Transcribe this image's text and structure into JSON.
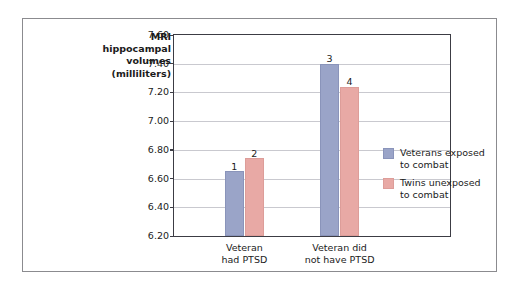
{
  "chart_data": {
    "type": "bar",
    "title": "",
    "ylabel_lines": [
      "MRI",
      "hippocampal",
      "volumes",
      "(milliliters)"
    ],
    "ylabel": "MRI hippocampal volumes (milliliters)",
    "xlabel": "",
    "categories": [
      "Veteran had PTSD",
      "Veteran did not have PTSD"
    ],
    "category_lines": [
      [
        "Veteran",
        "had PTSD"
      ],
      [
        "Veteran did",
        "not have PTSD"
      ]
    ],
    "series": [
      {
        "name": "Veterans exposed to combat",
        "name_lines": [
          "Veterans exposed",
          "to combat"
        ],
        "color": "#9aa4c8",
        "values": [
          6.65,
          7.4
        ],
        "point_labels": [
          "1",
          "3"
        ]
      },
      {
        "name": "Twins unexposed to combat",
        "name_lines": [
          "Twins unexposed",
          "to combat"
        ],
        "color": "#e8a9a5",
        "values": [
          6.74,
          7.24
        ],
        "point_labels": [
          "2",
          "4"
        ]
      }
    ],
    "ylim": [
      6.2,
      7.6
    ],
    "ytick_step": 0.2,
    "yticks": [
      6.2,
      6.4,
      6.6,
      6.8,
      7.0,
      7.2,
      7.4,
      7.6
    ],
    "ytick_labels": [
      "6.20",
      "6.40",
      "6.60",
      "6.80",
      "7.00",
      "7.20",
      "7.40",
      "7.60"
    ],
    "grid": true,
    "legend_position": "inside-right"
  },
  "colors": {
    "series_blue": "#9aa4c8",
    "series_pink": "#e8a9a5",
    "axis": "#3c3c44",
    "gridline": "#c9c9cf",
    "frame": "#8b8b8f",
    "text": "#1b1b1b",
    "background": "#ffffff"
  }
}
